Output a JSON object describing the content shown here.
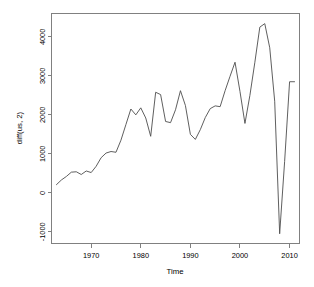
{
  "chart_data": {
    "type": "line",
    "title": "",
    "xlabel": "Time",
    "ylabel": "diff(us, 2)",
    "xlim": [
      1962.0,
      2012.0
    ],
    "ylim": [
      -1300,
      4600
    ],
    "grid": false,
    "legend": "none",
    "xticks": [
      1970,
      1980,
      1990,
      2000,
      2010
    ],
    "xtick_labels": [
      "1970",
      "1980",
      "1990",
      "2000",
      "2010"
    ],
    "yticks": [
      -1000,
      0,
      1000,
      2000,
      3000,
      4000
    ],
    "ytick_labels": [
      "-1000",
      "0",
      "1000",
      "2000",
      "3000",
      "4000"
    ],
    "series": [
      {
        "name": "diff(us, 2)",
        "color": "#4d4d4d",
        "x": [
          1963,
          1964,
          1965,
          1966,
          1967,
          1968,
          1969,
          1970,
          1971,
          1972,
          1973,
          1974,
          1975,
          1976,
          1977,
          1978,
          1979,
          1980,
          1981,
          1982,
          1983,
          1984,
          1985,
          1986,
          1987,
          1988,
          1989,
          1990,
          1991,
          1992,
          1993,
          1994,
          1995,
          1996,
          1997,
          1998,
          1999,
          2000,
          2001,
          2002,
          2003,
          2004,
          2005,
          2006,
          2007,
          2008,
          2009,
          2010,
          2011
        ],
        "y": [
          210,
          330,
          420,
          530,
          540,
          470,
          560,
          520,
          680,
          900,
          1020,
          1060,
          1040,
          1350,
          1750,
          2150,
          2000,
          2180,
          1920,
          1450,
          2580,
          2520,
          1830,
          1800,
          2130,
          2620,
          2240,
          1500,
          1370,
          1620,
          1930,
          2160,
          2230,
          2210,
          2620,
          2990,
          3350,
          2600,
          1780,
          2500,
          3350,
          4250,
          4340,
          3720,
          2350,
          -1050,
          800,
          2850,
          2850
        ]
      }
    ],
    "annotations": []
  },
  "axis": {
    "y_title": "diff(us, 2)",
    "x_title": "Time"
  }
}
